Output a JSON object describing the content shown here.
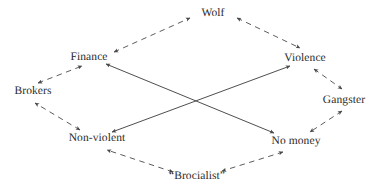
{
  "diagram": {
    "type": "node-link-diagram",
    "title": "",
    "background_color": "#ffffff",
    "text_color": "#2b2b2b",
    "edge_color": "#4a4a4a",
    "nodes": [
      {
        "id": "wolf",
        "label": "Wolf",
        "x": 213,
        "y": 13,
        "name": "node-wolf"
      },
      {
        "id": "finance",
        "label": "Finance",
        "x": 89,
        "y": 57,
        "name": "node-finance"
      },
      {
        "id": "violence",
        "label": "Violence",
        "x": 305,
        "y": 58,
        "name": "node-violence"
      },
      {
        "id": "brokers",
        "label": "Brokers",
        "x": 33,
        "y": 91,
        "name": "node-brokers"
      },
      {
        "id": "gangster",
        "label": "Gangster",
        "x": 344,
        "y": 100,
        "name": "node-gangster"
      },
      {
        "id": "nonviolent",
        "label": "Non-violent",
        "x": 97,
        "y": 138,
        "name": "node-non-violent"
      },
      {
        "id": "nomoney",
        "label": "No money",
        "x": 296,
        "y": 141,
        "name": "node-no-money"
      },
      {
        "id": "brocialist",
        "label": "“Brocialist”",
        "x": 197,
        "y": 176,
        "name": "node-brocialist"
      }
    ],
    "edges": [
      {
        "from": "finance",
        "to": "wolf",
        "style": "dashed",
        "arrows": "both",
        "name": "edge-finance-wolf"
      },
      {
        "from": "wolf",
        "to": "violence",
        "style": "dashed",
        "arrows": "both",
        "name": "edge-wolf-violence"
      },
      {
        "from": "violence",
        "to": "gangster",
        "style": "dashed",
        "arrows": "both",
        "name": "edge-violence-gangster"
      },
      {
        "from": "gangster",
        "to": "nomoney",
        "style": "dashed",
        "arrows": "both",
        "name": "edge-gangster-no-money"
      },
      {
        "from": "nomoney",
        "to": "brocialist",
        "style": "dashed",
        "arrows": "both",
        "name": "edge-no-money-brocialist"
      },
      {
        "from": "brocialist",
        "to": "nonviolent",
        "style": "dashed",
        "arrows": "both",
        "name": "edge-brocialist-non-violent"
      },
      {
        "from": "nonviolent",
        "to": "brokers",
        "style": "dashed",
        "arrows": "both",
        "name": "edge-non-violent-brokers"
      },
      {
        "from": "brokers",
        "to": "finance",
        "style": "dashed",
        "arrows": "both",
        "name": "edge-brokers-finance"
      },
      {
        "from": "finance",
        "to": "nomoney",
        "style": "solid",
        "arrows": "both",
        "name": "edge-finance-no-money"
      },
      {
        "from": "nonviolent",
        "to": "violence",
        "style": "solid",
        "arrows": "both",
        "name": "edge-non-violent-violence"
      }
    ]
  }
}
